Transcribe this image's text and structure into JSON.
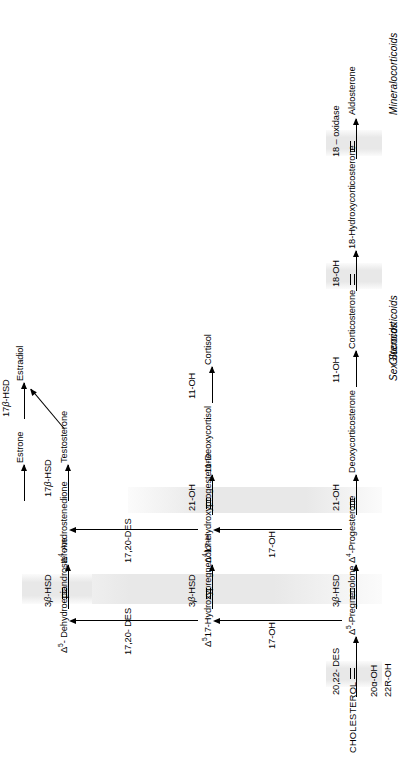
{
  "figure": {
    "orientation": "rotated-90-ccw"
  },
  "start": {
    "label": "CHOLESTEROL"
  },
  "zones": [
    {
      "name": "mineralocorticoids",
      "label": "Mineralocorticoids"
    },
    {
      "name": "glucocorticoids",
      "label": "Glucocorticoids"
    },
    {
      "name": "sex-steroids",
      "label": "Sex Steroids"
    }
  ],
  "rows": {
    "delta5_delta4_backbone": {
      "name": "mineralocorticoid-row",
      "nodes": [
        {
          "label": "Δ⁵-Pregnenolone",
          "delta": "5",
          "base": "-Pregnenolone"
        },
        {
          "label": "Δ⁴-Progesterone",
          "delta": "4",
          "base": "-Progesterone"
        },
        {
          "label": "Deoxycorticosterone"
        },
        {
          "label": "Corticosterone"
        },
        {
          "label": "18-Hydroxycorticosterone"
        },
        {
          "label": "Aldosterone"
        }
      ],
      "enzymes": [
        {
          "label": "20,22- DES",
          "double": true
        },
        {
          "label": "3β-HSD",
          "double": true
        },
        {
          "label": "21-OH",
          "double": true
        },
        {
          "label": "11-OH",
          "double": false
        },
        {
          "label": "18-OH",
          "double": true
        },
        {
          "label": "18 – oxidase",
          "double": true
        }
      ]
    },
    "hydroxy_row": {
      "name": "glucocorticoid-row",
      "nodes": [
        {
          "label": "Δ⁵17-Hydroxypregnenolone",
          "delta": "5",
          "base": "17-Hydroxypregnenolone"
        },
        {
          "label": "Δ⁴17-Hydroxyprogesterone",
          "delta": "4",
          "base": "17-Hydroxyprogesterone"
        },
        {
          "label": "11-Deoxycortisol"
        },
        {
          "label": "Cortisol"
        }
      ],
      "enzymes": [
        {
          "label": "3β-HSD",
          "double": true
        },
        {
          "label": "21-OH",
          "double": true
        },
        {
          "label": "11-OH",
          "double": false
        }
      ]
    },
    "androgen_row": {
      "name": "sex-steroid-row",
      "nodes": [
        {
          "label": "Δ⁵-Dehydroepiandrosterone",
          "delta": "5",
          "base": "-Dehydroepiandrosterone"
        },
        {
          "label": "Δ⁴-Androstenedione",
          "delta": "4",
          "base": "-Androstenedione"
        },
        {
          "label": "Testosterone"
        },
        {
          "label": "Estrone"
        },
        {
          "label": "Estradiol"
        }
      ],
      "enzymes": [
        {
          "label": "3β-HSD",
          "double": true
        },
        {
          "label": "17β-HSD",
          "double": false
        },
        {
          "label": "17β-HSD",
          "double": false
        }
      ]
    }
  },
  "vertical_enzymes": [
    {
      "label": "17-OH",
      "from": "Δ⁵-Pregnenolone",
      "to": "Δ⁵17-Hydroxypregnenolone"
    },
    {
      "label": "17-OH",
      "from": "Δ⁴-Progesterone",
      "to": "Δ⁴17-Hydroxyprogesterone"
    },
    {
      "label": "17,20- DES",
      "from": "Δ⁵17-Hydroxypregnenolone",
      "to": "Δ⁵-Dehydroepiandrosterone"
    },
    {
      "label": "17,20-DES",
      "from": "Δ⁴17-Hydroxyprogesterone",
      "to": "Δ⁴-Androstenedione"
    }
  ],
  "cofactor_labels": [
    {
      "label": "20α-OH"
    },
    {
      "label": "22R-OH"
    }
  ],
  "colors": {
    "ink": "#000000",
    "highlight_band": "#e8e8e8",
    "background": "#ffffff"
  }
}
